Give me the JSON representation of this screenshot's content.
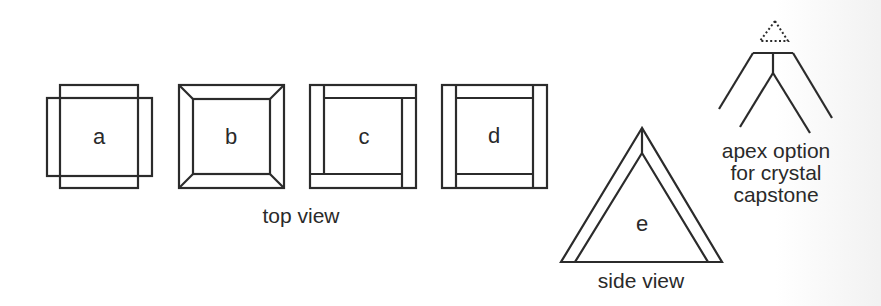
{
  "diagram": {
    "title": "",
    "background_color": "#ffffff",
    "line_color": "#2b2b2b",
    "top_view": {
      "caption": "top view",
      "figures": [
        {
          "id": "a",
          "label": "a",
          "description": "two overlapping rectangles (cross-lapped sides)"
        },
        {
          "id": "b",
          "label": "b",
          "description": "square frame with mitered corners"
        },
        {
          "id": "c",
          "label": "c",
          "description": "square frame with pinwheel (rotating butt) joints"
        },
        {
          "id": "d",
          "label": "d",
          "description": "square frame with side boards overlapping top/bottom"
        }
      ]
    },
    "side_view": {
      "caption": "side view",
      "figure": {
        "id": "e",
        "label": "e",
        "description": "triangle with inner offset triangle (double-walled face)"
      }
    },
    "apex_option": {
      "caption_lines": [
        "apex option",
        "for crystal",
        "capstone"
      ],
      "description": "dotted triangle capstone above split apex with center post"
    }
  }
}
